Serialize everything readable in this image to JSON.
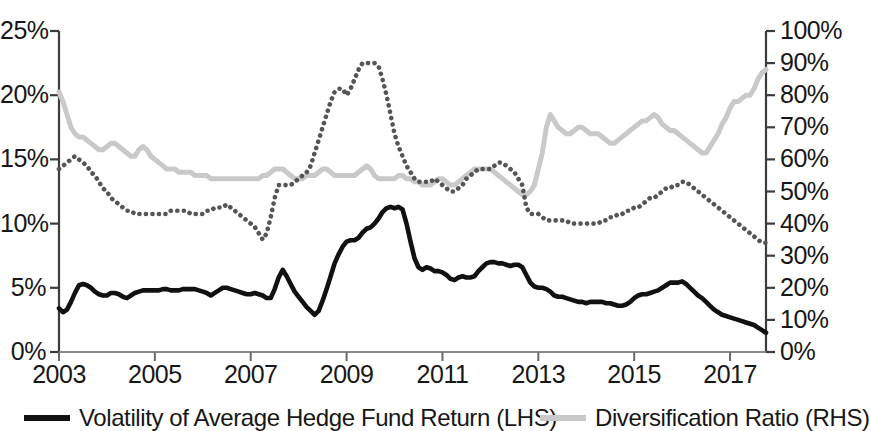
{
  "chart_data": {
    "type": "line",
    "title": "",
    "subtitle": "",
    "xlabel": "",
    "ylabel": "",
    "grid": false,
    "legend_position": "bottom",
    "x": [
      2003.0,
      2003.083,
      2003.167,
      2003.25,
      2003.333,
      2003.417,
      2003.5,
      2003.583,
      2003.667,
      2003.75,
      2003.833,
      2003.917,
      2004.0,
      2004.083,
      2004.167,
      2004.25,
      2004.333,
      2004.417,
      2004.5,
      2004.583,
      2004.667,
      2004.75,
      2004.833,
      2004.917,
      2005.0,
      2005.083,
      2005.167,
      2005.25,
      2005.333,
      2005.417,
      2005.5,
      2005.583,
      2005.667,
      2005.75,
      2005.833,
      2005.917,
      2006.0,
      2006.083,
      2006.167,
      2006.25,
      2006.333,
      2006.417,
      2006.5,
      2006.583,
      2006.667,
      2006.75,
      2006.833,
      2006.917,
      2007.0,
      2007.083,
      2007.167,
      2007.25,
      2007.333,
      2007.417,
      2007.5,
      2007.583,
      2007.667,
      2007.75,
      2007.833,
      2007.917,
      2008.0,
      2008.083,
      2008.167,
      2008.25,
      2008.333,
      2008.417,
      2008.5,
      2008.583,
      2008.667,
      2008.75,
      2008.833,
      2008.917,
      2009.0,
      2009.083,
      2009.167,
      2009.25,
      2009.333,
      2009.417,
      2009.5,
      2009.583,
      2009.667,
      2009.75,
      2009.833,
      2009.917,
      2010.0,
      2010.083,
      2010.167,
      2010.25,
      2010.333,
      2010.417,
      2010.5,
      2010.583,
      2010.667,
      2010.75,
      2010.833,
      2010.917,
      2011.0,
      2011.083,
      2011.167,
      2011.25,
      2011.333,
      2011.417,
      2011.5,
      2011.583,
      2011.667,
      2011.75,
      2011.833,
      2011.917,
      2012.0,
      2012.083,
      2012.167,
      2012.25,
      2012.333,
      2012.417,
      2012.5,
      2012.583,
      2012.667,
      2012.75,
      2012.833,
      2012.917,
      2013.0,
      2013.083,
      2013.167,
      2013.25,
      2013.333,
      2013.417,
      2013.5,
      2013.583,
      2013.667,
      2013.75,
      2013.833,
      2013.917,
      2014.0,
      2014.083,
      2014.167,
      2014.25,
      2014.333,
      2014.417,
      2014.5,
      2014.583,
      2014.667,
      2014.75,
      2014.833,
      2014.917,
      2015.0,
      2015.083,
      2015.167,
      2015.25,
      2015.333,
      2015.417,
      2015.5,
      2015.583,
      2015.667,
      2015.75,
      2015.833,
      2015.917,
      2016.0,
      2016.083,
      2016.167,
      2016.25,
      2016.333,
      2016.417,
      2016.5,
      2016.583,
      2016.667,
      2016.75,
      2016.833,
      2016.917,
      2017.0,
      2017.083,
      2017.167,
      2017.25,
      2017.333,
      2017.417,
      2017.5,
      2017.583,
      2017.667,
      2017.75
    ],
    "series": [
      {
        "name": "Volatility of Average Hedge Fund Return (LHS)",
        "axis": "left",
        "color": "#111111",
        "style": "solid",
        "unit": "%",
        "values": [
          3.4,
          3.1,
          3.3,
          3.9,
          4.6,
          5.2,
          5.3,
          5.2,
          5.0,
          4.7,
          4.5,
          4.4,
          4.4,
          4.6,
          4.6,
          4.5,
          4.3,
          4.2,
          4.4,
          4.6,
          4.7,
          4.8,
          4.8,
          4.8,
          4.8,
          4.8,
          4.9,
          4.9,
          4.8,
          4.8,
          4.8,
          4.9,
          4.9,
          4.9,
          4.9,
          4.8,
          4.7,
          4.6,
          4.4,
          4.6,
          4.8,
          5.0,
          5.0,
          4.9,
          4.8,
          4.7,
          4.6,
          4.5,
          4.5,
          4.6,
          4.5,
          4.4,
          4.2,
          4.2,
          4.9,
          5.8,
          6.4,
          5.9,
          5.3,
          4.7,
          4.3,
          3.9,
          3.5,
          3.2,
          2.9,
          3.2,
          4.0,
          4.9,
          5.9,
          6.9,
          7.6,
          8.2,
          8.6,
          8.7,
          8.7,
          8.9,
          9.3,
          9.6,
          9.7,
          10.0,
          10.4,
          10.9,
          11.2,
          11.3,
          11.2,
          11.3,
          11.1,
          10.0,
          8.6,
          7.3,
          6.6,
          6.4,
          6.6,
          6.5,
          6.3,
          6.3,
          6.2,
          6.0,
          5.7,
          5.6,
          5.8,
          5.9,
          5.8,
          5.8,
          5.9,
          6.3,
          6.6,
          6.9,
          7.0,
          7.0,
          6.9,
          6.9,
          6.8,
          6.7,
          6.8,
          6.8,
          6.6,
          6.0,
          5.4,
          5.1,
          5.0,
          5.0,
          4.9,
          4.7,
          4.4,
          4.3,
          4.3,
          4.2,
          4.1,
          4.0,
          3.9,
          3.9,
          3.8,
          3.9,
          3.9,
          3.9,
          3.9,
          3.8,
          3.8,
          3.7,
          3.6,
          3.6,
          3.7,
          3.9,
          4.2,
          4.4,
          4.5,
          4.5,
          4.6,
          4.7,
          4.8,
          5.0,
          5.2,
          5.4,
          5.4,
          5.4,
          5.5,
          5.3,
          5.0,
          4.7,
          4.4,
          4.2,
          3.9,
          3.6,
          3.3,
          3.1,
          2.9,
          2.8,
          2.7,
          2.6,
          2.5,
          2.4,
          2.3,
          2.2,
          2.1,
          1.9,
          1.7,
          1.5
        ]
      },
      {
        "name": "Diversification Ratio (RHS)",
        "axis": "right",
        "color": "#c9c9c9",
        "style": "solid",
        "unit": "%",
        "values": [
          81,
          78,
          74,
          70,
          68,
          67,
          67,
          66,
          65,
          64,
          63,
          63,
          64,
          65,
          65,
          64,
          63,
          62,
          61,
          61,
          63,
          64,
          63,
          61,
          60,
          59,
          58,
          57,
          57,
          57,
          56,
          56,
          56,
          56,
          55,
          55,
          55,
          55,
          54,
          54,
          54,
          54,
          54,
          54,
          54,
          54,
          54,
          54,
          54,
          54,
          54,
          55,
          55,
          56,
          57,
          57,
          57,
          56,
          55,
          54,
          54,
          54,
          55,
          55,
          55,
          56,
          57,
          57,
          56,
          55,
          55,
          55,
          55,
          55,
          55,
          56,
          57,
          58,
          57,
          55,
          54,
          54,
          54,
          54,
          54,
          55,
          55,
          54,
          54,
          53,
          53,
          52,
          52,
          52,
          53,
          54,
          54,
          53,
          52,
          52,
          53,
          54,
          55,
          56,
          57,
          57,
          57,
          57,
          57,
          56,
          55,
          54,
          53,
          52,
          51,
          50,
          49,
          49,
          50,
          52,
          57,
          62,
          70,
          74,
          72,
          70,
          69,
          68,
          68,
          69,
          70,
          70,
          69,
          68,
          68,
          68,
          67,
          66,
          65,
          65,
          66,
          67,
          68,
          69,
          70,
          71,
          72,
          72,
          73,
          74,
          73,
          71,
          70,
          69,
          69,
          68,
          67,
          66,
          65,
          64,
          63,
          62,
          62,
          64,
          66,
          68,
          71,
          73,
          76,
          78,
          78,
          79,
          80,
          80,
          82,
          85,
          87,
          88
        ]
      },
      {
        "name": "Dispersion of Hedge Fund Returns",
        "axis": "right",
        "color": "#555555",
        "style": "dotted",
        "unit": "%",
        "values": [
          57,
          58,
          59,
          60,
          61,
          60,
          59,
          58,
          56,
          55,
          53,
          51,
          50,
          48,
          47,
          46,
          45,
          44,
          44,
          43,
          43,
          43,
          43,
          43,
          43,
          43,
          43,
          43,
          44,
          44,
          44,
          44,
          44,
          43,
          43,
          43,
          43,
          44,
          44,
          45,
          45,
          45,
          46,
          45,
          44,
          43,
          42,
          41,
          40,
          39,
          37,
          35,
          37,
          42,
          48,
          52,
          52,
          52,
          52,
          53,
          54,
          55,
          56,
          58,
          62,
          66,
          70,
          74,
          78,
          81,
          82,
          82,
          80,
          82,
          85,
          88,
          90,
          90,
          90,
          90,
          89,
          85,
          80,
          74,
          68,
          64,
          61,
          58,
          56,
          54,
          53,
          53,
          53,
          53,
          54,
          53,
          52,
          51,
          50,
          50,
          51,
          52,
          54,
          55,
          56,
          57,
          57,
          57,
          57,
          58,
          59,
          59,
          58,
          57,
          56,
          54,
          52,
          45,
          43,
          43,
          43,
          42,
          41,
          41,
          41,
          41,
          41,
          41,
          40,
          40,
          40,
          40,
          40,
          40,
          40,
          40,
          41,
          41,
          42,
          42,
          43,
          43,
          44,
          44,
          45,
          45,
          46,
          47,
          48,
          48,
          49,
          50,
          51,
          51,
          52,
          52,
          53,
          53,
          52,
          51,
          50,
          49,
          48,
          47,
          46,
          45,
          44,
          43,
          42,
          41,
          40,
          39,
          38,
          37,
          36,
          35,
          34,
          34
        ]
      }
    ],
    "x_ticks": [
      2003,
      2005,
      2007,
      2009,
      2011,
      2013,
      2015,
      2017
    ],
    "x_tick_labels": [
      "2003",
      "2005",
      "2007",
      "2009",
      "2011",
      "2013",
      "2015",
      "2017"
    ],
    "xlim": [
      2003,
      2017.75
    ],
    "y_left_ticks": [
      0,
      5,
      10,
      15,
      20,
      25
    ],
    "y_left_tick_labels": [
      "0%",
      "5%",
      "10%",
      "15%",
      "20%",
      "25%"
    ],
    "ylim_left": [
      0,
      25
    ],
    "y_right_ticks": [
      0,
      10,
      20,
      30,
      40,
      50,
      60,
      70,
      80,
      90,
      100
    ],
    "y_right_tick_labels": [
      "0%",
      "10%",
      "20%",
      "30%",
      "40%",
      "50%",
      "60%",
      "70%",
      "80%",
      "90%",
      "100%"
    ],
    "ylim_right": [
      0,
      100
    ],
    "legend": [
      {
        "label": "Volatility of Average Hedge Fund Return (LHS)",
        "swatch": "solid-black"
      },
      {
        "label": "Diversification Ratio (RHS)",
        "swatch": "solid-gray"
      }
    ]
  }
}
